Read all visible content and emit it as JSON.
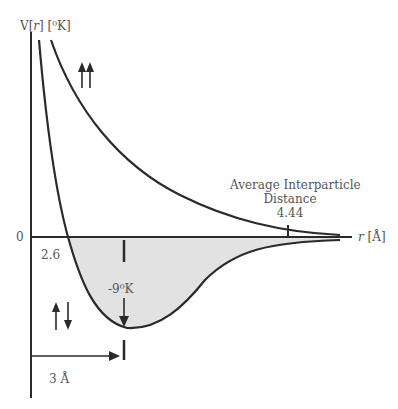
{
  "axes": {
    "y_label": "V[r] [°K]",
    "y_label_parts": {
      "v": "V[",
      "r": "r",
      "rest": "] [⁰K]"
    },
    "x_label_r": "r",
    "x_label_unit": "[Å]",
    "x_unit_ring": "0",
    "zero_label": "0"
  },
  "annotations": {
    "zero_crossing": "2.6",
    "well_depth": "-9⁰K",
    "avg_distance_line1": "Average Interparticle",
    "avg_distance_line2": "Distance",
    "avg_distance_value": "4.44",
    "min_distance_value": "3",
    "min_distance_unit": "Å",
    "min_distance_unit_ring": "0"
  },
  "spin_labels": {
    "parallel": "↑↑",
    "antiparallel": "↑↓"
  },
  "colors": {
    "line": "#2a2a2a",
    "fill": "#e2e2e2",
    "text": "#555555"
  }
}
